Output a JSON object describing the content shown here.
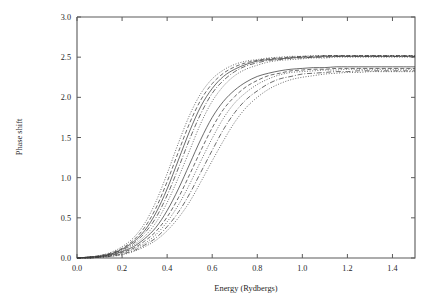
{
  "figure": {
    "background_color": "#ffffff",
    "axis_color": "#5a5a5a",
    "curve_color": "#3b3b3b"
  },
  "chart_data": {
    "type": "line",
    "title": "",
    "subtitle": "",
    "xlabel": "Energy (Rydbergs)",
    "ylabel": "Phase shift",
    "xlim": [
      0.0,
      1.5
    ],
    "ylim": [
      0.0,
      3.0
    ],
    "xticks": [
      0.0,
      0.2,
      0.4,
      0.6,
      0.8,
      1.0,
      1.2,
      1.4
    ],
    "xticklabels": [
      "0.0",
      "0.2",
      "0.4",
      "0.6",
      "0.8",
      "1.0",
      "1.2",
      "1.4"
    ],
    "yticks": [
      0.0,
      0.5,
      1.0,
      1.5,
      2.0,
      2.5,
      3.0
    ],
    "yticklabels": [
      "0.0",
      "0.5",
      "1.0",
      "1.5",
      "2.0",
      "2.5",
      "3.0"
    ],
    "grid": false,
    "legend": null,
    "legend_position": "none",
    "annotations": [],
    "x": [
      0.0,
      0.05,
      0.1,
      0.15,
      0.2,
      0.25,
      0.3,
      0.35,
      0.4,
      0.45,
      0.5,
      0.55,
      0.6,
      0.65,
      0.7,
      0.75,
      0.8,
      0.85,
      0.9,
      0.95,
      1.0,
      1.05,
      1.1,
      1.15,
      1.2,
      1.25,
      1.3,
      1.35,
      1.4,
      1.45,
      1.5
    ],
    "series": [
      {
        "name": "curve-1",
        "style": "dotted",
        "asymptote": 2.52,
        "midpoint": 0.46,
        "values": [
          0.0,
          0.01,
          0.03,
          0.07,
          0.14,
          0.25,
          0.43,
          0.7,
          1.05,
          1.43,
          1.78,
          2.05,
          2.23,
          2.34,
          2.41,
          2.45,
          2.47,
          2.49,
          2.5,
          2.51,
          2.51,
          2.52,
          2.52,
          2.52,
          2.52,
          2.52,
          2.52,
          2.52,
          2.52,
          2.52,
          2.52
        ]
      },
      {
        "name": "curve-2",
        "style": "dashed",
        "asymptote": 2.52,
        "midpoint": 0.48,
        "values": [
          0.0,
          0.01,
          0.03,
          0.06,
          0.12,
          0.22,
          0.38,
          0.62,
          0.95,
          1.32,
          1.68,
          1.97,
          2.17,
          2.3,
          2.38,
          2.43,
          2.46,
          2.48,
          2.49,
          2.5,
          2.51,
          2.51,
          2.52,
          2.52,
          2.52,
          2.52,
          2.52,
          2.52,
          2.52,
          2.52,
          2.52
        ]
      },
      {
        "name": "curve-3",
        "style": "solid",
        "asymptote": 2.51,
        "midpoint": 0.5,
        "values": [
          0.0,
          0.01,
          0.02,
          0.05,
          0.11,
          0.2,
          0.34,
          0.56,
          0.86,
          1.22,
          1.58,
          1.89,
          2.11,
          2.26,
          2.35,
          2.41,
          2.45,
          2.47,
          2.48,
          2.49,
          2.5,
          2.5,
          2.51,
          2.51,
          2.51,
          2.51,
          2.51,
          2.51,
          2.51,
          2.51,
          2.51
        ]
      },
      {
        "name": "curve-4",
        "style": "dashdot",
        "asymptote": 2.51,
        "midpoint": 0.525,
        "values": [
          0.0,
          0.01,
          0.02,
          0.05,
          0.1,
          0.18,
          0.31,
          0.5,
          0.78,
          1.12,
          1.48,
          1.8,
          2.05,
          2.21,
          2.32,
          2.39,
          2.43,
          2.46,
          2.47,
          2.49,
          2.49,
          2.5,
          2.5,
          2.51,
          2.51,
          2.51,
          2.51,
          2.51,
          2.51,
          2.51,
          2.51
        ]
      },
      {
        "name": "curve-5",
        "style": "dotted",
        "asymptote": 2.5,
        "midpoint": 0.555,
        "values": [
          0.0,
          0.01,
          0.02,
          0.04,
          0.09,
          0.16,
          0.27,
          0.44,
          0.69,
          1.0,
          1.34,
          1.68,
          1.95,
          2.14,
          2.27,
          2.35,
          2.4,
          2.44,
          2.46,
          2.47,
          2.48,
          2.49,
          2.49,
          2.5,
          2.5,
          2.5,
          2.5,
          2.5,
          2.5,
          2.5,
          2.5
        ]
      },
      {
        "name": "curve-6",
        "style": "solid",
        "asymptote": 2.38,
        "midpoint": 0.595,
        "values": [
          0.0,
          0.01,
          0.02,
          0.04,
          0.08,
          0.14,
          0.24,
          0.38,
          0.59,
          0.86,
          1.17,
          1.48,
          1.75,
          1.95,
          2.09,
          2.19,
          2.26,
          2.3,
          2.33,
          2.35,
          2.36,
          2.37,
          2.37,
          2.38,
          2.38,
          2.38,
          2.38,
          2.38,
          2.38,
          2.38,
          2.38
        ]
      },
      {
        "name": "curve-7",
        "style": "dashed",
        "asymptote": 2.36,
        "midpoint": 0.625,
        "values": [
          0.0,
          0.0,
          0.01,
          0.03,
          0.07,
          0.12,
          0.21,
          0.33,
          0.51,
          0.75,
          1.04,
          1.34,
          1.62,
          1.85,
          2.01,
          2.13,
          2.21,
          2.27,
          2.3,
          2.33,
          2.34,
          2.35,
          2.35,
          2.36,
          2.36,
          2.36,
          2.36,
          2.36,
          2.36,
          2.36,
          2.36
        ]
      },
      {
        "name": "curve-8",
        "style": "dotted",
        "asymptote": 2.35,
        "midpoint": 0.655,
        "values": [
          0.0,
          0.0,
          0.01,
          0.03,
          0.06,
          0.11,
          0.18,
          0.29,
          0.45,
          0.66,
          0.92,
          1.21,
          1.49,
          1.74,
          1.93,
          2.06,
          2.16,
          2.23,
          2.28,
          2.31,
          2.32,
          2.33,
          2.34,
          2.34,
          2.35,
          2.35,
          2.35,
          2.35,
          2.35,
          2.35,
          2.35
        ]
      },
      {
        "name": "curve-9",
        "style": "dashdot",
        "asymptote": 2.33,
        "midpoint": 0.69,
        "values": [
          0.0,
          0.0,
          0.01,
          0.02,
          0.05,
          0.09,
          0.16,
          0.25,
          0.39,
          0.57,
          0.8,
          1.07,
          1.34,
          1.6,
          1.81,
          1.97,
          2.08,
          2.17,
          2.23,
          2.26,
          2.29,
          2.3,
          2.31,
          2.32,
          2.32,
          2.33,
          2.33,
          2.33,
          2.33,
          2.33,
          2.33
        ]
      },
      {
        "name": "curve-10",
        "style": "dotted",
        "asymptote": 2.32,
        "midpoint": 0.72,
        "values": [
          0.0,
          0.0,
          0.01,
          0.02,
          0.04,
          0.08,
          0.14,
          0.22,
          0.34,
          0.5,
          0.7,
          0.95,
          1.21,
          1.46,
          1.69,
          1.87,
          2.0,
          2.1,
          2.17,
          2.22,
          2.25,
          2.27,
          2.29,
          2.3,
          2.31,
          2.31,
          2.32,
          2.32,
          2.32,
          2.32,
          2.32
        ]
      }
    ]
  }
}
